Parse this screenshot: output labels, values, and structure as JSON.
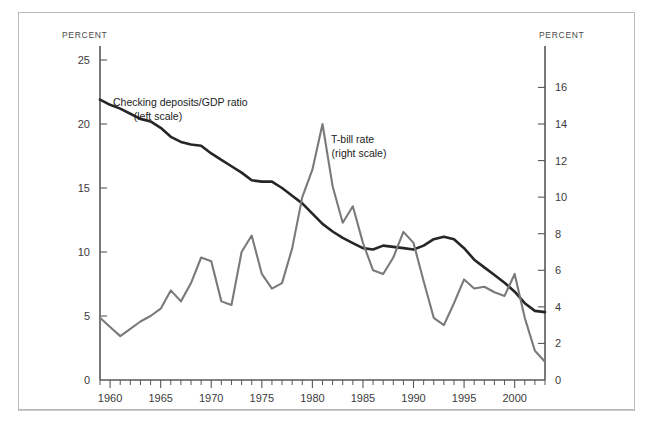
{
  "chart_data": {
    "type": "line",
    "title": "",
    "xlabel": "",
    "left_axis_title": "PERCENT",
    "right_axis_title": "PERCENT",
    "x": [
      1959,
      1960,
      1961,
      1962,
      1963,
      1964,
      1965,
      1966,
      1967,
      1968,
      1969,
      1970,
      1971,
      1972,
      1973,
      1974,
      1975,
      1976,
      1977,
      1978,
      1979,
      1980,
      1981,
      1982,
      1983,
      1984,
      1985,
      1986,
      1987,
      1988,
      1989,
      1990,
      1991,
      1992,
      1993,
      1994,
      1995,
      1996,
      1997,
      1998,
      1999,
      2000,
      2001,
      2002,
      2003
    ],
    "xlim": [
      1959,
      2003
    ],
    "xticks": [
      1960,
      1965,
      1970,
      1975,
      1980,
      1985,
      1990,
      1995,
      2000
    ],
    "xticklabels": [
      "1960",
      "1965",
      "1970",
      "1975",
      "1980",
      "1985",
      "1990",
      "1995",
      "2000"
    ],
    "xtick_minor_step": 1,
    "left_ylim": [
      0,
      25
    ],
    "left_yticks": [
      0,
      5,
      10,
      15,
      20,
      25
    ],
    "left_yticklabels": [
      "0",
      "5",
      "10",
      "15",
      "20",
      "25"
    ],
    "right_ylim": [
      0,
      17.5
    ],
    "right_yticks": [
      0,
      2,
      4,
      6,
      8,
      10,
      12,
      14,
      16
    ],
    "right_yticklabels": [
      "0",
      "2",
      "4",
      "6",
      "8",
      "10",
      "12",
      "14",
      "16"
    ],
    "grid": false,
    "legend_position": "inline-annotation",
    "series": [
      {
        "name": "Checking deposits/GDP ratio",
        "axis": "left",
        "color": "#262626",
        "annotation": "Checking deposits/GDP ratio",
        "annotation_sub": "(left scale)",
        "values": [
          21.9,
          21.5,
          21.2,
          20.8,
          20.4,
          20.2,
          19.7,
          19.0,
          18.6,
          18.4,
          18.3,
          17.7,
          17.2,
          16.7,
          16.2,
          15.6,
          15.5,
          15.5,
          15.0,
          14.4,
          13.8,
          13.0,
          12.2,
          11.6,
          11.1,
          10.7,
          10.3,
          10.2,
          10.5,
          10.4,
          10.3,
          10.2,
          10.5,
          11.0,
          11.2,
          11.0,
          10.3,
          9.4,
          8.8,
          8.2,
          7.6,
          6.9,
          6.0,
          5.4,
          5.3
        ]
      },
      {
        "name": "T-bill rate",
        "axis": "right",
        "color": "#7a7a7a",
        "annotation": "T-bill rate",
        "annotation_sub": "(right scale)",
        "values": [
          3.4,
          2.9,
          2.4,
          2.8,
          3.2,
          3.5,
          3.9,
          4.9,
          4.3,
          5.3,
          6.7,
          6.5,
          4.3,
          4.1,
          7.0,
          7.9,
          5.8,
          5.0,
          5.3,
          7.2,
          10.0,
          11.5,
          14.0,
          10.6,
          8.6,
          9.5,
          7.5,
          6.0,
          5.8,
          6.7,
          8.1,
          7.5,
          5.4,
          3.4,
          3.0,
          4.2,
          5.5,
          5.0,
          5.1,
          4.8,
          4.6,
          5.8,
          3.4,
          1.6,
          1.0
        ]
      }
    ]
  },
  "axes": {
    "left_title": "PERCENT",
    "right_title": "PERCENT"
  }
}
